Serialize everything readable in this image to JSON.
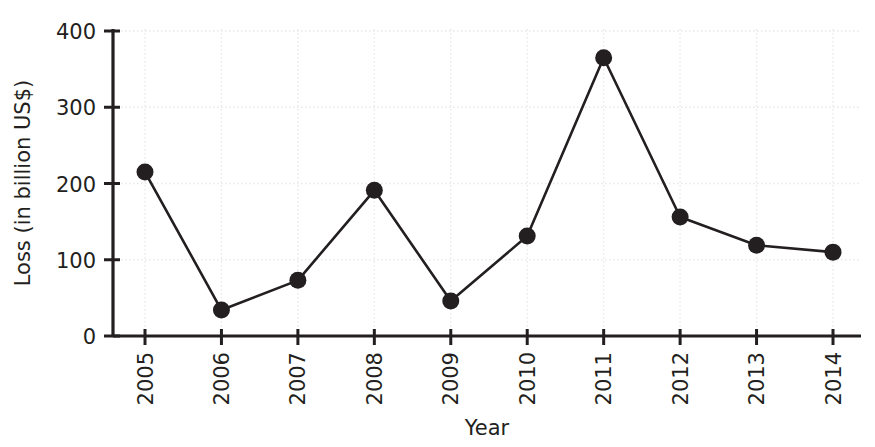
{
  "chart_data": {
    "type": "line",
    "title": "",
    "xlabel": "Year",
    "ylabel": "Loss (in billion US$)",
    "categories": [
      "2005",
      "2006",
      "2007",
      "2008",
      "2009",
      "2010",
      "2011",
      "2012",
      "2013",
      "2014"
    ],
    "values": [
      215,
      34,
      73,
      191,
      46,
      131,
      365,
      156,
      119,
      110
    ],
    "series": [
      {
        "name": "Loss",
        "values": [
          215,
          34,
          73,
          191,
          46,
          131,
          365,
          156,
          119,
          110
        ]
      }
    ],
    "ylim": [
      0,
      400
    ],
    "yticks": [
      0,
      100,
      200,
      300,
      400
    ],
    "ytick_labels": [
      "0",
      "100",
      "200",
      "300",
      "400"
    ],
    "xtick_labels": [
      "2005",
      "2006",
      "2007",
      "2008",
      "2009",
      "2010",
      "2011",
      "2012",
      "2013",
      "2014"
    ],
    "grid": true,
    "legend": false,
    "marker": "circle",
    "line_color": "#231f20",
    "marker_color": "#231f20",
    "grid_color": "#e8e8ea",
    "axis_color": "#231f20",
    "background": "#ffffff",
    "xtick_label_rotation": 90
  }
}
